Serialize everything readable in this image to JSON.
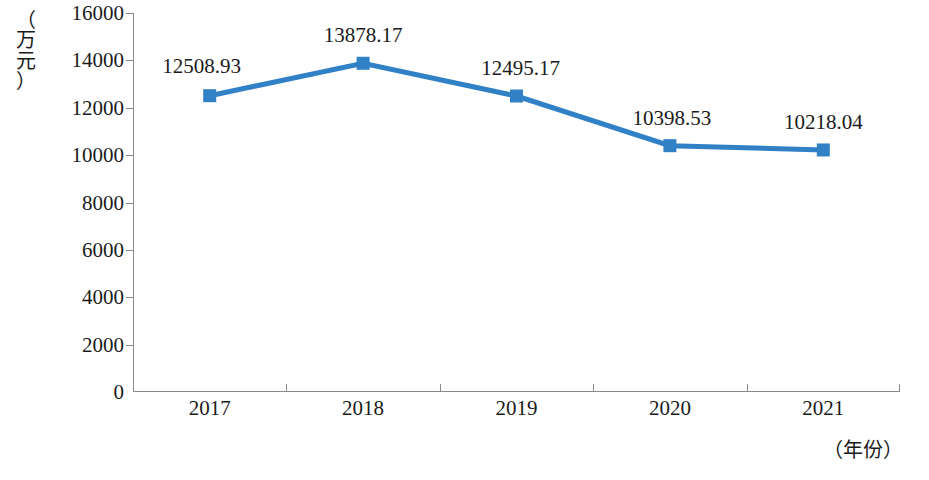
{
  "chart_data": {
    "type": "line",
    "title": "",
    "subtitle": "",
    "xlabel": "（年份）",
    "ylabel": "（万元）",
    "categories": [
      "2017",
      "2018",
      "2019",
      "2020",
      "2021"
    ],
    "values": [
      12508.93,
      13878.17,
      12495.17,
      10398.53,
      10218.04
    ],
    "point_labels": [
      "12508.93",
      "13878.17",
      "12495.17",
      "10398.53",
      "10218.04"
    ],
    "series": [
      {
        "name": "",
        "values": [
          12508.93,
          13878.17,
          12495.17,
          10398.53,
          10218.04
        ],
        "color": "#3181C6",
        "marker": "square",
        "line_width": 5
      }
    ],
    "ylim": [
      0,
      16000
    ],
    "ytick_labels": [
      "16000",
      "14000",
      "12000",
      "10000",
      "8000",
      "6000",
      "4000",
      "2000",
      "0"
    ],
    "ytick_values": [
      16000,
      14000,
      12000,
      10000,
      8000,
      6000,
      4000,
      2000,
      0
    ],
    "grid": false,
    "legend": "none",
    "axis_color": "#8a8a8a",
    "text_color": "#1b1b1b",
    "background": "#ffffff"
  },
  "axes": {
    "y_title_chars": "（\n万\n元\n）",
    "x_title": "（年份）"
  }
}
